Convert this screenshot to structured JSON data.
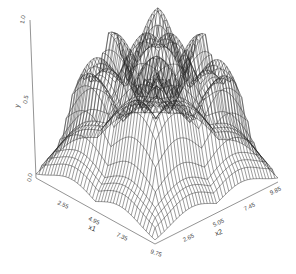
{
  "chart_data": {
    "type": "surface3d",
    "title": "",
    "x1": {
      "label": "x1",
      "ticks": [
        "2.55",
        "4.95",
        "7.35",
        "9.75"
      ],
      "range": [
        0.15,
        9.75
      ]
    },
    "x2": {
      "label": "x2",
      "ticks": [
        "2.65",
        "5.05",
        "7.45",
        "9.85"
      ],
      "range": [
        0.25,
        9.85
      ]
    },
    "y": {
      "label": "y",
      "ticks": [
        "0.0",
        "0.5",
        "1.0"
      ],
      "range": [
        0.0,
        1.0
      ]
    },
    "mesh": {
      "grid_lines": 40,
      "color": "#222222"
    },
    "grid": false,
    "legend": null
  },
  "axes": {
    "z_ticks": [
      "1.0",
      "0.5",
      "0.0"
    ],
    "z_label": "y",
    "x1_ticks": [
      "2.55",
      "4.95",
      "7.35",
      "9.75"
    ],
    "x1_label": "x1",
    "x2_ticks": [
      "2.65",
      "5.05",
      "7.45",
      "9.85"
    ],
    "x2_label": "x2"
  }
}
